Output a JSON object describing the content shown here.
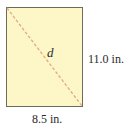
{
  "diagram": {
    "shape": "rectangle",
    "fill_color": "#fdf6c6",
    "border_color": "#6b6b5e",
    "diagonal_color": "#e0a98c",
    "diagonal_label": "d",
    "height_label": "11.0 in.",
    "width_label": "8.5 in."
  }
}
